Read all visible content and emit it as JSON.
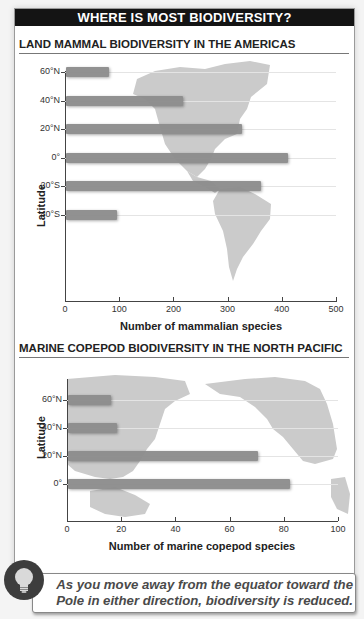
{
  "header": {
    "title": "WHERE IS MOST BIODIVERSITY?"
  },
  "charts": [
    {
      "title": "LAND MAMMAL BIODIVERSITY IN THE AMERICAS",
      "ylabel": "Latitude",
      "xlabel": "Number of mammalian species",
      "ytick_labels": [
        "60°N",
        "40°N",
        "20°N",
        "0°",
        "20°S",
        "40°S"
      ],
      "xtick_labels": [
        "0",
        "100",
        "200",
        "300",
        "400",
        "500"
      ],
      "background_map": "Americas (North and South America)"
    },
    {
      "title": "MARINE COPEPOD BIODIVERSITY IN THE NORTH PACIFIC",
      "ylabel": "Latitude",
      "xlabel": "Number of marine copepod species",
      "ytick_labels": [
        "60°N",
        "40°N",
        "20°N",
        "0°"
      ],
      "xtick_labels": [
        "0",
        "20",
        "40",
        "60",
        "80",
        "100"
      ],
      "background_map": "North Pacific (Asia, Australia, North America)"
    }
  ],
  "callout": {
    "icon": "lightbulb-icon",
    "text": "As you move away from the equator toward the Pole in either direction, biodiversity is reduced."
  },
  "colors": {
    "bar": "#8c8c8c",
    "map": "#c8c8c8",
    "header_bg": "#141414"
  },
  "chart_data": [
    {
      "type": "bar",
      "orientation": "horizontal",
      "title": "LAND MAMMAL BIODIVERSITY IN THE AMERICAS",
      "categories": [
        "60°N",
        "40°N",
        "20°N",
        "0°",
        "20°S",
        "40°S"
      ],
      "values": [
        80,
        215,
        325,
        410,
        360,
        95
      ],
      "xlabel": "Number of mammalian species",
      "ylabel": "Latitude",
      "xlim": [
        0,
        500
      ],
      "xticks": [
        0,
        100,
        200,
        300,
        400,
        500
      ],
      "grid": true,
      "legend": null
    },
    {
      "type": "bar",
      "orientation": "horizontal",
      "title": "MARINE COPEPOD BIODIVERSITY IN THE NORTH PACIFIC",
      "categories": [
        "60°N",
        "40°N",
        "20°N",
        "0°"
      ],
      "values": [
        16,
        18,
        70,
        82
      ],
      "xlabel": "Number of marine copepod species",
      "ylabel": "Latitude",
      "xlim": [
        0,
        100
      ],
      "xticks": [
        0,
        20,
        40,
        60,
        80,
        100
      ],
      "grid": true,
      "legend": null
    }
  ]
}
